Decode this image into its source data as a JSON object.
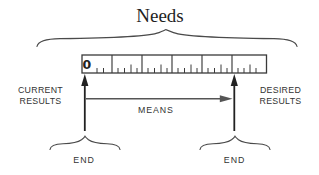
{
  "title": "Needs",
  "ruler": {
    "origin_label": "0"
  },
  "left_label": {
    "line1": "CURRENT",
    "line2": "RESULTS"
  },
  "right_label": {
    "line1": "DESIRED",
    "line2": "RESULTS"
  },
  "means_label": "MEANS",
  "ends": {
    "left": "END",
    "right": "END"
  },
  "colors": {
    "background": "#ffffff",
    "ink": "#222222",
    "line_gray": "#555555",
    "text": "#333333"
  }
}
